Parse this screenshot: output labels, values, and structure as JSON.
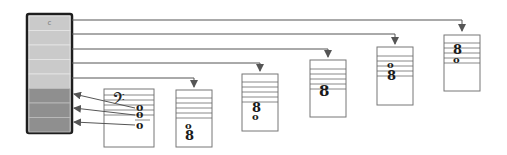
{
  "diagram": {
    "type": "register-to-staff mapping",
    "column": {
      "cells": [
        {
          "label": "c",
          "shade": "light"
        },
        {
          "label": "",
          "shade": "light"
        },
        {
          "label": "",
          "shade": "light"
        },
        {
          "label": "",
          "shade": "light"
        },
        {
          "label": "",
          "shade": "light"
        },
        {
          "label": "",
          "shade": "dark"
        },
        {
          "label": "",
          "shade": "dark"
        },
        {
          "label": "",
          "shade": "dark"
        }
      ]
    },
    "boxes": [
      {
        "id": "bass",
        "clef": "𝄢",
        "notes": [
          "o",
          "o",
          "o"
        ],
        "direction": "to-column"
      },
      {
        "id": "box2",
        "notes": [
          "o",
          "8"
        ],
        "direction": "from-column"
      },
      {
        "id": "box3",
        "notes": [
          "8",
          "o"
        ],
        "direction": "from-column"
      },
      {
        "id": "box4",
        "notes": [
          "8"
        ],
        "direction": "from-column"
      },
      {
        "id": "box5",
        "notes": [
          "o",
          "8"
        ],
        "direction": "from-column"
      },
      {
        "id": "box6",
        "notes": [
          "8",
          "o"
        ],
        "direction": "from-column"
      }
    ],
    "colors": {
      "light_cell": "#cacaca",
      "dark_cell": "#8f8f8f",
      "frame": "#1e1e1e",
      "wire": "#555555"
    }
  }
}
